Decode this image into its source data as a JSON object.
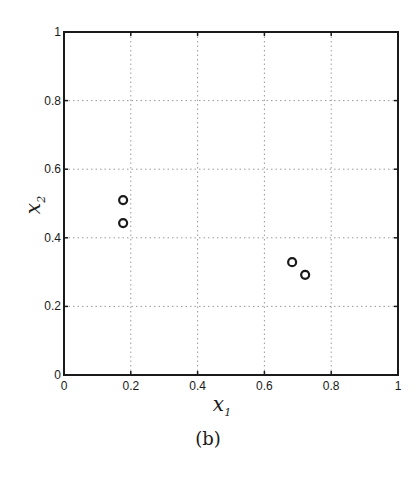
{
  "chart_data": {
    "type": "scatter",
    "title": "",
    "caption": "(b)",
    "xlabel": "x",
    "xlabel_sub": "1",
    "ylabel": "x",
    "ylabel_sub": "2",
    "xlim": [
      0,
      1
    ],
    "ylim": [
      0,
      1
    ],
    "xticks": [
      0,
      0.2,
      0.4,
      0.6,
      0.8,
      1
    ],
    "xtick_labels": [
      "0",
      "0.2",
      "0.4",
      "0.6",
      "0.8",
      "1"
    ],
    "yticks": [
      0,
      0.2,
      0.4,
      0.6,
      0.8,
      1
    ],
    "ytick_labels": [
      "0",
      "0.2",
      "0.4",
      "0.6",
      "0.8",
      "1"
    ],
    "grid": true,
    "grid_style": "dotted",
    "marker": "open-circle",
    "series": [
      {
        "name": "points",
        "x": [
          0.177,
          0.177,
          0.683,
          0.722
        ],
        "y": [
          0.51,
          0.443,
          0.329,
          0.292
        ]
      }
    ],
    "colors": {
      "axes": "#1a1a1a",
      "grid": "#9a9a9a",
      "marker": "#1a1a1a",
      "background": "#ffffff"
    }
  }
}
